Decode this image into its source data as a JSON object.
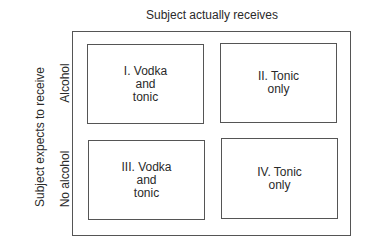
{
  "diagram": {
    "column_axis_label": "Subject actually receives",
    "row_axis_label": "Subject expects to receive",
    "row_labels": [
      "Alcohol",
      "No alcohol"
    ],
    "cells": [
      {
        "id": "I",
        "label": "I. Vodka\nand\ntonic",
        "expects": "Alcohol",
        "receives": "Vodka and tonic"
      },
      {
        "id": "II",
        "label": "II. Tonic\nonly",
        "expects": "Alcohol",
        "receives": "Tonic only"
      },
      {
        "id": "III",
        "label": "III. Vodka\nand\ntonic",
        "expects": "No alcohol",
        "receives": "Vodka and tonic"
      },
      {
        "id": "IV",
        "label": "IV. Tonic\nonly",
        "expects": "No alcohol",
        "receives": "Tonic only"
      }
    ]
  }
}
